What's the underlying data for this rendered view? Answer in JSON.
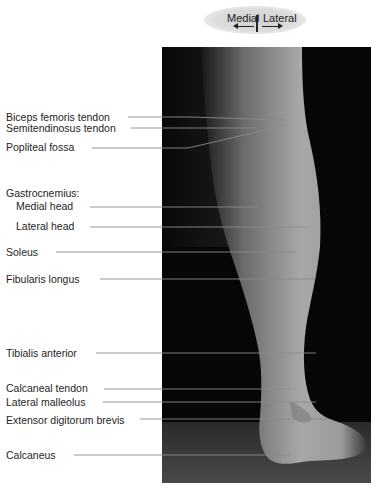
{
  "orientation": {
    "left_label": "Medial",
    "right_label": "Lateral",
    "left_arrow_icon": "arrow-left-icon",
    "right_arrow_icon": "arrow-right-icon"
  },
  "figure": {
    "labels": [
      {
        "text": "Biceps femoris tendon",
        "y": 117
      },
      {
        "text": "Semitendinosus tendon",
        "y": 128
      },
      {
        "text": "Popliteal fossa",
        "y": 147
      },
      {
        "text": "Gastrocnemius:",
        "y": 193
      },
      {
        "text": "Medial head",
        "y": 206
      },
      {
        "text": "Lateral head",
        "y": 226
      },
      {
        "text": "Soleus",
        "y": 252
      },
      {
        "text": "Fibularis longus",
        "y": 279
      },
      {
        "text": "Tibialis anterior",
        "y": 353
      },
      {
        "text": "Calcaneal tendon",
        "y": 388
      },
      {
        "text": "Lateral malleolus",
        "y": 402
      },
      {
        "text": "Extensor digitorum brevis",
        "y": 420
      },
      {
        "text": "Calcaneus",
        "y": 455
      }
    ]
  }
}
